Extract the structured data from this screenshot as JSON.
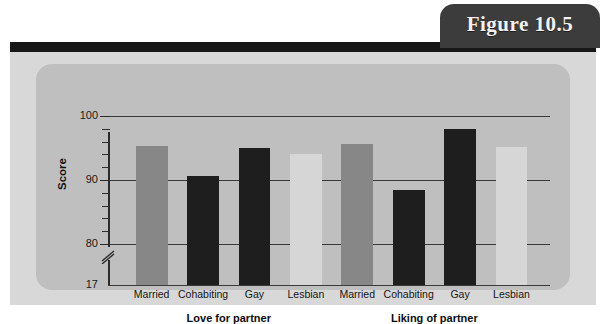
{
  "figure": {
    "tab_label": "Figure 10.5"
  },
  "chart_data": {
    "type": "bar",
    "title": "",
    "xlabel": "",
    "ylabel": "Score",
    "ylim": [
      17,
      100
    ],
    "axis_break": true,
    "axis_break_between": [
      17,
      80
    ],
    "ytick_labels": [
      "100",
      "90",
      "80",
      "17"
    ],
    "ytick_values": [
      100,
      90,
      80,
      17
    ],
    "grid": true,
    "grid_values": [
      100,
      90,
      80
    ],
    "legend": "none",
    "groups": [
      {
        "label": "Love for partner",
        "categories": [
          "Married",
          "Cohabiting",
          "Gay",
          "Lesbian"
        ],
        "values": [
          95.3,
          90.7,
          95.0,
          94.1
        ],
        "colors": [
          "#878787",
          "#1e1e1e",
          "#1e1e1e",
          "#d6d6d6"
        ]
      },
      {
        "label": "Liking of partner",
        "categories": [
          "Married",
          "Cohabiting",
          "Gay",
          "Lesbian"
        ],
        "values": [
          95.6,
          88.4,
          98.0,
          95.2
        ],
        "colors": [
          "#878787",
          "#1e1e1e",
          "#1e1e1e",
          "#d6d6d6"
        ]
      }
    ],
    "colors": {
      "bar_married": "#878787",
      "bar_dark": "#1e1e1e",
      "bar_light": "#d6d6d6",
      "panel_background": "#bfbfbf",
      "card_background": "#d8d8d8",
      "topbar": "#171717",
      "tab_background": "#3c3c3c",
      "tab_text": "#f2f2f2",
      "gridline": "#3a3a3a"
    }
  }
}
